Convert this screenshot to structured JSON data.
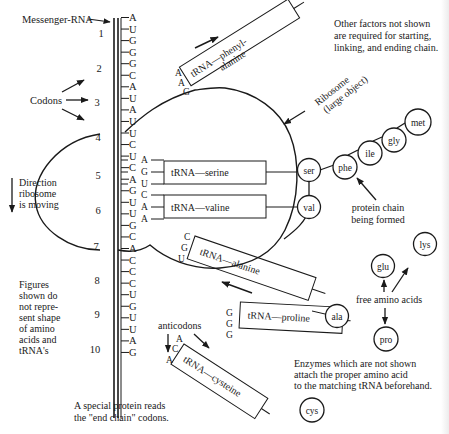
{
  "figure": {
    "mrna_label": "Messenger-RNA",
    "codons_label": "Codons",
    "direction_label": [
      "Direction",
      "ribosome",
      "is moving"
    ],
    "figures_note": [
      "Figures",
      "shown do",
      "not repre-",
      "sent shape",
      "of amino",
      "acids and",
      "tRNA's"
    ],
    "factors_note": [
      "Other factors not shown",
      "are required for starting,",
      "linking, and ending chain."
    ],
    "ribosome_label": [
      "Ribosome",
      "(large object)"
    ],
    "protein_chain_label": [
      "protein chain",
      "being formed"
    ],
    "free_amino_label": "free amino acids",
    "anticodons_label": "anticodons",
    "enzymes_note": [
      "Enzymes which are not shown",
      "attach the proper amino acid",
      "to the matching tRNA beforehand."
    ],
    "special_protein_note": [
      "A special protein reads",
      "the \"end chain\" codons."
    ],
    "codon_numbers": [
      "1",
      "2",
      "3",
      "4",
      "5",
      "6",
      "7",
      "8",
      "9",
      "10"
    ],
    "mrna_bases": [
      "A",
      "U",
      "G",
      "G",
      "G",
      "C",
      "A",
      "U",
      "A",
      "U",
      "U",
      "C",
      "U",
      "C",
      "A",
      "G",
      "U",
      "U",
      "G",
      "C",
      "A",
      "C",
      "C",
      "C",
      "U",
      "G",
      "U",
      "U",
      "A",
      "G"
    ],
    "trnas": [
      {
        "name": "tRNA—phenyl-",
        "name2": "alanine",
        "anticodon": [
          "A",
          "A",
          "G"
        ]
      },
      {
        "name": "tRNA—serine",
        "anticodon": [
          "A",
          "G",
          "U"
        ]
      },
      {
        "name": "tRNA—valine",
        "anticodon": [
          "C",
          "A",
          "A"
        ]
      },
      {
        "name": "tRNA—alanine",
        "anticodon": [
          "C",
          "G",
          "U"
        ]
      },
      {
        "name": "tRNA—proline",
        "anticodon": [
          "G",
          "G",
          "G"
        ]
      },
      {
        "name": "tRNA—cysteine",
        "anticodon": [
          "A",
          "C",
          "A"
        ]
      }
    ],
    "chain_amino_acids": [
      "val",
      "ser",
      "phe",
      "ile",
      "gly",
      "met"
    ],
    "attached_amino_acids": [
      "ala"
    ],
    "free_amino_acids": [
      "lys",
      "glu",
      "pro",
      "cys"
    ]
  }
}
